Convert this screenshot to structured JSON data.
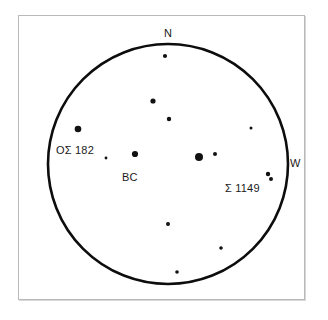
{
  "figure": {
    "kind": "star-chart",
    "background_color": "#ffffff",
    "frame_color": "#b9b9b9",
    "ink_color": "#111111"
  },
  "field": {
    "circle": {
      "cx": 168,
      "cy": 164,
      "r": 120
    },
    "stroke_width": 2.6
  },
  "cardinals": [
    {
      "name": "north",
      "label": "N",
      "x": 164,
      "y": 28
    },
    {
      "name": "west",
      "label": "W",
      "x": 290,
      "y": 158
    }
  ],
  "star_labels": [
    {
      "name": "omicron-struve-182",
      "label": "OΣ 182",
      "x": 56,
      "y": 145
    },
    {
      "name": "bc",
      "label": "BC",
      "x": 122,
      "y": 172
    },
    {
      "name": "struve-1149",
      "label": "Σ 1149",
      "x": 225,
      "y": 183
    }
  ],
  "chart_data": {
    "type": "scatter",
    "title": "",
    "xlabel": "",
    "ylabel": "",
    "grid": false,
    "legend": false,
    "projection": "eyepiece-field-of-view",
    "field_boundary": {
      "shape": "circle",
      "cx": 168,
      "cy": 164,
      "r": 120
    },
    "orientation": {
      "top": "N",
      "right": "W"
    },
    "point_key": [
      "x",
      "y",
      "r"
    ],
    "points": [
      {
        "id": "s1",
        "x": 165,
        "y": 56,
        "r": 2.1,
        "note": "near north edge"
      },
      {
        "id": "s2",
        "x": 153,
        "y": 101,
        "r": 2.6
      },
      {
        "id": "s3",
        "x": 169,
        "y": 119,
        "r": 2.2
      },
      {
        "id": "s4",
        "x": 78,
        "y": 129,
        "r": 3.3,
        "label": "OΣ 182"
      },
      {
        "id": "s5",
        "x": 251,
        "y": 128,
        "r": 1.5
      },
      {
        "id": "s6",
        "x": 106,
        "y": 158,
        "r": 1.4
      },
      {
        "id": "s7",
        "x": 135,
        "y": 154,
        "r": 3.1,
        "label": "BC"
      },
      {
        "id": "s8",
        "x": 199,
        "y": 157,
        "r": 4.0,
        "note": "brightest star"
      },
      {
        "id": "s9",
        "x": 215,
        "y": 154,
        "r": 2.0
      },
      {
        "id": "s10",
        "x": 268,
        "y": 174,
        "r": 2.2,
        "label": "Σ 1149",
        "note": "double primary"
      },
      {
        "id": "s11",
        "x": 271,
        "y": 179,
        "r": 2.0,
        "note": "double secondary"
      },
      {
        "id": "s12",
        "x": 168,
        "y": 224,
        "r": 2.0
      },
      {
        "id": "s13",
        "x": 221,
        "y": 248,
        "r": 1.8
      },
      {
        "id": "s14",
        "x": 177,
        "y": 272,
        "r": 1.8,
        "note": "near south edge"
      }
    ]
  }
}
